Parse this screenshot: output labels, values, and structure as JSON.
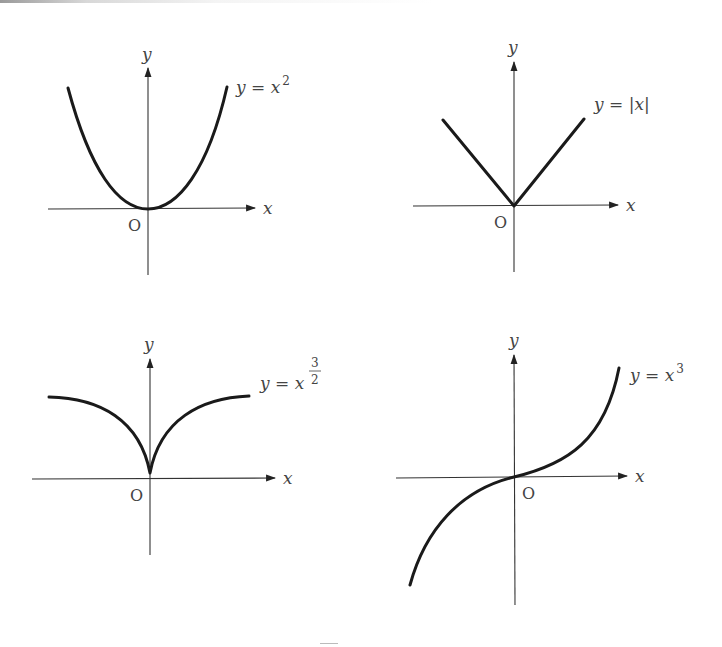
{
  "figure": {
    "panels": [
      {
        "id": "square",
        "equation": "y = x²",
        "equation_base": "y = x",
        "equation_exp": "2",
        "x_label": "x",
        "y_label": "y",
        "origin_label": "O"
      },
      {
        "id": "abs",
        "equation": "y = |x|",
        "equation_base": "y = |x|",
        "equation_exp": "",
        "x_label": "x",
        "y_label": "y",
        "origin_label": "O"
      },
      {
        "id": "three-halves",
        "equation": "y = x^(3/2)",
        "equation_base": "y = x",
        "equation_exp_num": "3",
        "equation_exp_den": "2",
        "x_label": "x",
        "y_label": "y",
        "origin_label": "O"
      },
      {
        "id": "cube",
        "equation": "y = x³",
        "equation_base": "y = x",
        "equation_exp": "3",
        "x_label": "x",
        "y_label": "y",
        "origin_label": "O"
      }
    ],
    "colors": {
      "curve": "#1a1a1a",
      "axis": "#333333",
      "text": "#444444"
    }
  }
}
